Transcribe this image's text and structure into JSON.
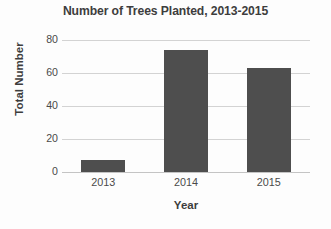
{
  "chart_data": {
    "type": "bar",
    "title": "Number of Trees Planted, 2013-2015",
    "xlabel": "Year",
    "ylabel": "Total Number",
    "categories": [
      "2013",
      "2014",
      "2015"
    ],
    "values": [
      7,
      74,
      63
    ],
    "ylim": [
      0,
      80
    ],
    "yticks": [
      0,
      20,
      40,
      60,
      80
    ],
    "ytick_labels": [
      "0",
      "20",
      "40",
      "60",
      "80"
    ],
    "grid": "horizontal",
    "legend": "none",
    "bar_color": "#4e4e4e",
    "gridline_color": "#d3d3d3",
    "text_color": "#3d3d3d",
    "background_color": "#fdfdfd"
  }
}
